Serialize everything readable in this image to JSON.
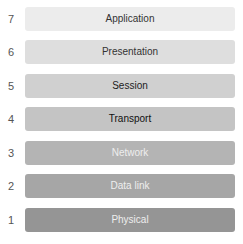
{
  "layers": [
    {
      "number": "7",
      "name": "Application",
      "fill": "#ececec",
      "text_color": "#333333"
    },
    {
      "number": "6",
      "name": "Presentation",
      "fill": "#dedede",
      "text_color": "#333333"
    },
    {
      "number": "5",
      "name": "Session",
      "fill": "#d0d0d0",
      "text_color": "#222222"
    },
    {
      "number": "4",
      "name": "Transport",
      "fill": "#c4c4c4",
      "text_color": "#111111"
    },
    {
      "number": "3",
      "name": "Network",
      "fill": "#b4b4b4",
      "text_color": "#eeeeee"
    },
    {
      "number": "2",
      "name": "Data link",
      "fill": "#a6a6a6",
      "text_color": "#eeeeee"
    },
    {
      "number": "1",
      "name": "Physical",
      "fill": "#959595",
      "text_color": "#eeeeee"
    }
  ]
}
